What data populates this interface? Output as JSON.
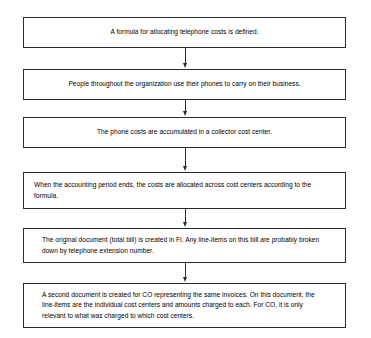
{
  "diagram": {
    "type": "flowchart",
    "orientation": "top-to-bottom",
    "background_color": "#ffffff",
    "border_color": "#2b2b2b",
    "text_color": "#000000",
    "nodes": [
      {
        "id": "step-1",
        "text": "A formula for allocating telephone costs is defined.",
        "align": "center"
      },
      {
        "id": "step-2",
        "text": "People throughout the organization use their phones to carry on their business.",
        "align": "center"
      },
      {
        "id": "step-3",
        "text": "The phone costs are accumulated in a collector cost center.",
        "align": "center"
      },
      {
        "id": "step-4",
        "text": "When the accounting period ends, the costs are allocated across cost centers according to the formula.",
        "align": "left"
      },
      {
        "id": "step-5",
        "text": "The original document (total bill) is created in FI.  Any line-items on this bill are probably broken down by telephone extension number.",
        "align": "left-indent"
      },
      {
        "id": "step-6",
        "text": "A second document is created for CO representing the same invoices. On this document, the line-items are the individual cost centers and amounts charged to each. For CO, it is only relevant to what was charged to which cost centers.",
        "align": "left-indent"
      }
    ],
    "connectors": [
      {
        "id": "arrow-1-2",
        "from": "step-1",
        "to": "step-2",
        "icon": "arrow-down-icon"
      },
      {
        "id": "arrow-2-3",
        "from": "step-2",
        "to": "step-3",
        "icon": "arrow-down-icon"
      },
      {
        "id": "arrow-3-4",
        "from": "step-3",
        "to": "step-4",
        "icon": "arrow-down-icon"
      },
      {
        "id": "arrow-4-5",
        "from": "step-4",
        "to": "step-5",
        "icon": "arrow-down-icon"
      },
      {
        "id": "arrow-5-6",
        "from": "step-5",
        "to": "step-6",
        "icon": "arrow-down-icon"
      }
    ]
  }
}
